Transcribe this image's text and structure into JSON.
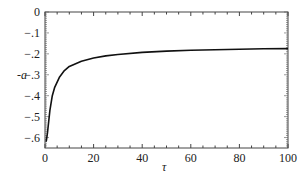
{
  "chart_data": {
    "type": "line",
    "title": "",
    "xlabel": "τ",
    "ylabel": "-a",
    "xlim": [
      0,
      100
    ],
    "ylim": [
      -0.65,
      0
    ],
    "x_ticks": [
      "0",
      "20",
      "40",
      "60",
      "80",
      "100"
    ],
    "y_ticks": [
      "0",
      "-.1",
      "-.2",
      "-.3",
      "-.4",
      "-.5",
      "-.6"
    ],
    "grid": false,
    "legend": null,
    "series": [
      {
        "name": "-a",
        "x": [
          0.5,
          1,
          2,
          3,
          4,
          6,
          8,
          10,
          15,
          20,
          25,
          30,
          40,
          50,
          60,
          70,
          80,
          90,
          100
        ],
        "values": [
          -0.62,
          -0.58,
          -0.47,
          -0.4,
          -0.36,
          -0.31,
          -0.28,
          -0.26,
          -0.235,
          -0.22,
          -0.21,
          -0.203,
          -0.193,
          -0.187,
          -0.183,
          -0.18,
          -0.178,
          -0.176,
          -0.175
        ]
      }
    ]
  }
}
